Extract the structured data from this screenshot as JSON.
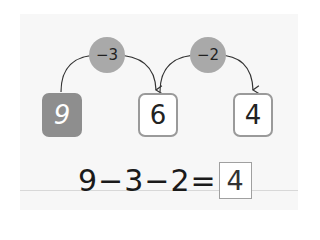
{
  "diagram": {
    "start_value": "9",
    "steps": [
      {
        "operation": "−3",
        "result": "6"
      },
      {
        "operation": "−2",
        "result": "4"
      }
    ]
  },
  "equation": {
    "parts": [
      "9",
      "−",
      "3",
      "−",
      "2",
      "="
    ],
    "answer": "4"
  },
  "colors": {
    "start_box": "#8e8e8e",
    "operation_circle": "#a9a9a9",
    "panel_background": "#f7f7f7",
    "result_border": "#9a9a9a"
  }
}
